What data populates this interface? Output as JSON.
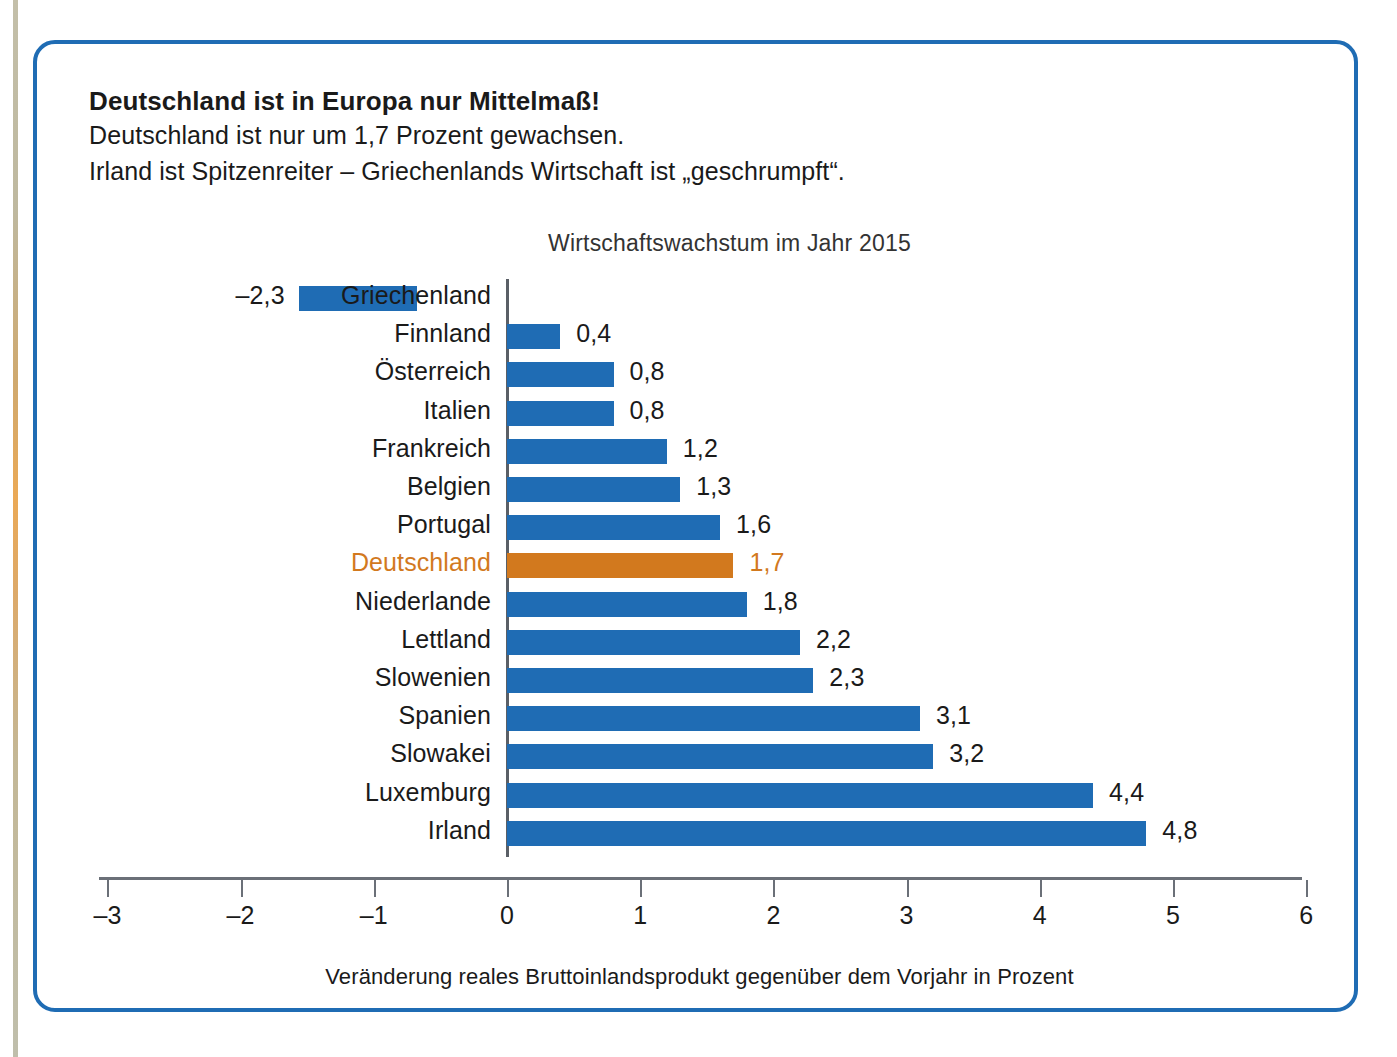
{
  "header": {
    "title": "Deutschland ist in Europa nur Mittelmaß!",
    "line2": "Deutschland ist nur um 1,7 Prozent gewachsen.",
    "line3": "Irland ist Spitzenreiter – Griechenlands Wirtschaft ist „geschrumpft“."
  },
  "colors": {
    "bar": "#1f6cb4",
    "highlight": "#d2791e",
    "frame": "#1f6cb4",
    "axis": "#6b7078",
    "text": "#1a1a1a"
  },
  "chart_data": {
    "type": "bar",
    "orientation": "horizontal",
    "title": "Wirtschaftswachstum im Jahr 2015",
    "xlabel": "Veränderung reales Bruttoinlandsprodukt gegenüber dem Vorjahr in Prozent",
    "ylabel": "",
    "xlim": [
      -3,
      6
    ],
    "xticks": [
      "–3",
      "–2",
      "–1",
      "0",
      "1",
      "2",
      "3",
      "4",
      "5",
      "6"
    ],
    "xtick_values": [
      -3,
      -2,
      -1,
      0,
      1,
      2,
      3,
      4,
      5,
      6
    ],
    "grid": false,
    "legend": "none",
    "highlight_category": "Deutschland",
    "categories": [
      "Griechenland",
      "Finnland",
      "Österreich",
      "Italien",
      "Frankreich",
      "Belgien",
      "Portugal",
      "Deutschland",
      "Niederlande",
      "Lettland",
      "Slowenien",
      "Spanien",
      "Slowakei",
      "Luxemburg",
      "Irland"
    ],
    "values": [
      -2.3,
      0.4,
      0.8,
      0.8,
      1.2,
      1.3,
      1.6,
      1.7,
      1.8,
      2.2,
      2.3,
      3.1,
      3.2,
      4.4,
      4.8
    ],
    "value_labels": [
      "–2,3",
      "0,4",
      "0,8",
      "0,8",
      "1,2",
      "1,3",
      "1,6",
      "1,7",
      "1,8",
      "2,2",
      "2,3",
      "3,1",
      "3,2",
      "4,4",
      "4,8"
    ]
  }
}
